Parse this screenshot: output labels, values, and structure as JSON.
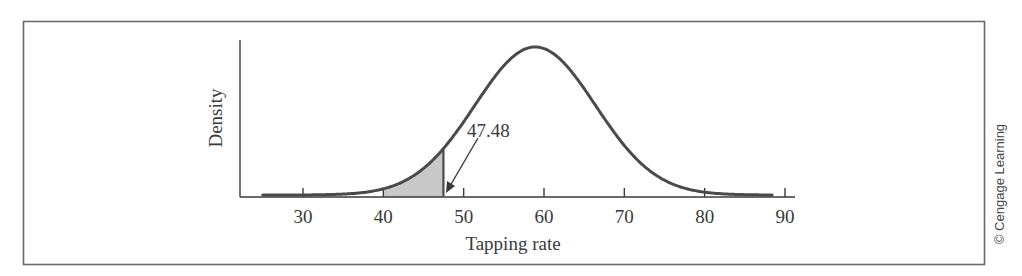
{
  "chart_data": {
    "type": "line",
    "subtype": "normal-density-curve",
    "title": "",
    "xlabel": "Tapping rate",
    "ylabel": "Density",
    "x_ticks": [
      30,
      40,
      50,
      60,
      70,
      80,
      90
    ],
    "x_tick_labels": [
      "30",
      "40",
      "50",
      "60",
      "70",
      "80",
      "90"
    ],
    "xlim": [
      22,
      91
    ],
    "y_ticks": [],
    "distribution": {
      "family": "normal",
      "mean": 58.9,
      "sd": 7.5
    },
    "curve_range": [
      25,
      88.5
    ],
    "shaded_region": {
      "from": 40,
      "to": 47.48,
      "fill": "#c8c8c8",
      "description": "lower tail area left of 47.48"
    },
    "annotations": [
      {
        "text": "47.48",
        "x": 47.48,
        "arrow_points_to": "shaded region right edge at baseline"
      }
    ],
    "grid": false,
    "legend": null
  },
  "labels": {
    "xlabel": "Tapping rate",
    "ylabel": "Density",
    "annotation": "47.48",
    "credit": "© Cengage Learning",
    "ticks": [
      "30",
      "40",
      "50",
      "60",
      "70",
      "80",
      "90"
    ]
  },
  "colors": {
    "curve": "#4a4a4a",
    "axis": "#3a3a3a",
    "frame": "#6a6a6a",
    "shade": "#c8c8c8",
    "text": "#3a3a3a"
  }
}
